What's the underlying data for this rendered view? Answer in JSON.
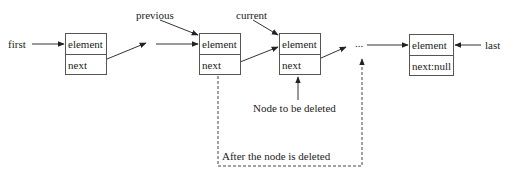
{
  "diagram": {
    "type": "linked-list-node-deletion",
    "pointers": {
      "first": "first",
      "previous": "previous",
      "current": "current",
      "last": "last"
    },
    "nodes": [
      {
        "element": "element",
        "next": "next"
      },
      {
        "element": "element",
        "next": "next"
      },
      {
        "element": "element",
        "next": "next"
      },
      {
        "element": "element",
        "next": "next:null"
      }
    ],
    "ellipsis": "...",
    "annotations": {
      "node_to_delete": "Node to be deleted",
      "after_deletion": "After the node is deleted"
    },
    "colors": {
      "line": "#333333",
      "box_border": "#555555",
      "text": "#222222"
    }
  }
}
